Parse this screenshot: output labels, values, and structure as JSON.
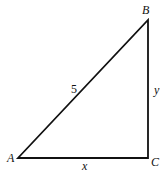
{
  "diagram": {
    "type": "right-triangle",
    "stroke_color": "#111111",
    "background": "#ffffff",
    "vertices": {
      "A": {
        "label": "A",
        "x": 18,
        "y": 158
      },
      "B": {
        "label": "B",
        "x": 148,
        "y": 20
      },
      "C": {
        "label": "C",
        "x": 148,
        "y": 158
      }
    },
    "sides": {
      "hypotenuse_AB": {
        "label": "5"
      },
      "vertical_BC": {
        "label": "y"
      },
      "horizontal_AC": {
        "label": "x"
      }
    }
  }
}
